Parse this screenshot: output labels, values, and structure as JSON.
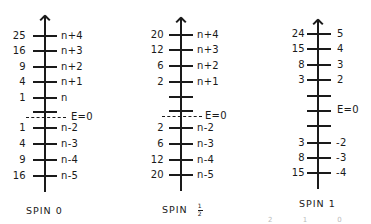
{
  "diagram": {
    "panels": [
      {
        "title": "SPIN 0",
        "zero_label": "E=0",
        "levels_above": [
          {
            "value": "25",
            "label": "n+4"
          },
          {
            "value": "16",
            "label": "n+3"
          },
          {
            "value": "9",
            "label": "n+2"
          },
          {
            "value": "4",
            "label": "n+1"
          },
          {
            "value": "1",
            "label": "n"
          }
        ],
        "levels_below": [
          {
            "value": "1",
            "label": "n-2"
          },
          {
            "value": "4",
            "label": "n-3"
          },
          {
            "value": "9",
            "label": "n-4"
          },
          {
            "value": "16",
            "label": "n-5"
          }
        ]
      },
      {
        "title": "SPIN",
        "title_fraction": {
          "numerator": "1",
          "denominator": "2"
        },
        "zero_label": "E=0",
        "levels_above": [
          {
            "value": "20",
            "label": "n+4"
          },
          {
            "value": "12",
            "label": "n+3"
          },
          {
            "value": "6",
            "label": "n+2"
          },
          {
            "value": "2",
            "label": "n+1"
          }
        ],
        "levels_below": [
          {
            "value": "2",
            "label": "n-2"
          },
          {
            "value": "6",
            "label": "n-3"
          },
          {
            "value": "12",
            "label": "n-4"
          },
          {
            "value": "20",
            "label": "n-5"
          }
        ]
      },
      {
        "title": "SPIN 1",
        "zero_label": "E=0",
        "levels_above": [
          {
            "value": "24",
            "label": "5"
          },
          {
            "value": "15",
            "label": "4"
          },
          {
            "value": "8",
            "label": "3"
          },
          {
            "value": "3",
            "label": "2"
          }
        ],
        "levels_below": [
          {
            "value": "3",
            "label": "-2"
          },
          {
            "value": "8",
            "label": "-3"
          },
          {
            "value": "15",
            "label": "-4"
          }
        ]
      }
    ],
    "footer_faint": "2  1  0"
  }
}
